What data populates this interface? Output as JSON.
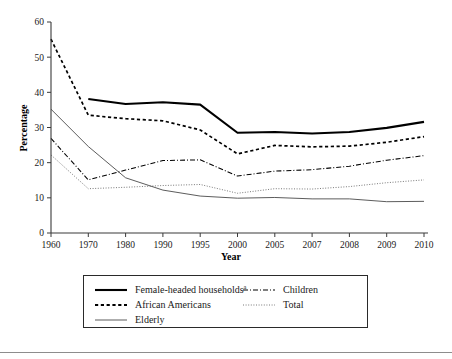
{
  "chart_data": {
    "type": "line",
    "title": "",
    "xlabel": "Year",
    "ylabel": "Percentage",
    "categories": [
      "1960",
      "1970",
      "1980",
      "1990",
      "1995",
      "2000",
      "2005",
      "2007",
      "2008",
      "2009",
      "2010"
    ],
    "ylim": [
      0,
      60
    ],
    "yticks": [
      0,
      10,
      20,
      30,
      40,
      50,
      60
    ],
    "grid": false,
    "legend_position": "below-plot",
    "series": [
      {
        "name": "Female-headed households",
        "name_superscript": "a",
        "style": "solid-thick",
        "values": [
          null,
          38.1,
          36.7,
          37.2,
          36.5,
          28.5,
          28.7,
          28.3,
          28.7,
          29.9,
          31.6
        ]
      },
      {
        "name": "African Americans",
        "style": "dashed",
        "values": [
          55.1,
          33.5,
          32.5,
          31.9,
          29.3,
          22.5,
          24.9,
          24.5,
          24.7,
          25.8,
          27.4
        ]
      },
      {
        "name": "Elderly",
        "style": "solid-thin",
        "values": [
          35.2,
          24.6,
          15.7,
          12.2,
          10.5,
          9.9,
          10.1,
          9.7,
          9.7,
          8.9,
          9.0
        ]
      },
      {
        "name": "Children",
        "style": "dash-dot",
        "values": [
          26.9,
          15.1,
          17.9,
          20.6,
          20.8,
          16.2,
          17.6,
          18.0,
          19.0,
          20.7,
          22.0
        ]
      },
      {
        "name": "Total",
        "style": "dotted",
        "values": [
          22.2,
          12.6,
          13.0,
          13.5,
          13.8,
          11.3,
          12.6,
          12.5,
          13.2,
          14.3,
          15.1
        ]
      }
    ]
  },
  "axes": {
    "y_label": "Percentage",
    "x_label": "Year",
    "y_tick_labels": [
      "0",
      "10",
      "20",
      "30",
      "40",
      "50",
      "60"
    ],
    "x_tick_labels": [
      "1960",
      "1970",
      "1980",
      "1990",
      "1995",
      "2000",
      "2005",
      "2007",
      "2008",
      "2009",
      "2010"
    ]
  },
  "legend": {
    "items": [
      {
        "label": "Female-headed households",
        "superscript": "a",
        "style": "solid-thick",
        "column": 1
      },
      {
        "label": "Children",
        "superscript": "",
        "style": "dash-dot",
        "column": 2
      },
      {
        "label": "African Americans",
        "superscript": "",
        "style": "dashed",
        "column": 1
      },
      {
        "label": "Total",
        "superscript": "",
        "style": "dotted",
        "column": 2
      },
      {
        "label": "Elderly",
        "superscript": "",
        "style": "solid-thin",
        "column": 1
      }
    ]
  },
  "colors": {
    "ink": "#000000",
    "axis": "#3a3a3a",
    "muted": "#6a6a6a",
    "background": "#ffffff"
  }
}
